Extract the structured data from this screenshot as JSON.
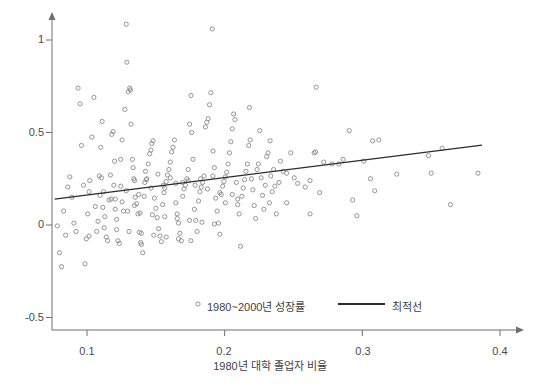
{
  "chart_data": {
    "type": "scatter",
    "title": "",
    "xlabel": "1980년 대학 졸업자 비율",
    "ylabel": "",
    "xlim": [
      0.072,
      0.415
    ],
    "ylim": [
      -0.52,
      1.13
    ],
    "grid": false,
    "xticks": [
      "0.1",
      "0.2",
      "0.3",
      "0.4"
    ],
    "xtick_values": [
      0.1,
      0.2,
      0.3,
      0.4
    ],
    "yticks": [
      "1",
      "0.5",
      "0",
      "-0.5"
    ],
    "ytick_values": [
      1,
      0.5,
      0,
      -0.5
    ],
    "legend_position": "lower-center",
    "series": [
      {
        "name": "1980~2000년 성장률",
        "marker": "open-circle",
        "color": "#8a8a8a",
        "points": [
          [
            0.0785,
            -0.005
          ],
          [
            0.08,
            -0.15
          ],
          [
            0.0815,
            -0.225
          ],
          [
            0.083,
            0.075
          ],
          [
            0.0845,
            -0.055
          ],
          [
            0.086,
            0.205
          ],
          [
            0.0875,
            0.26
          ],
          [
            0.089,
            0.15
          ],
          [
            0.0905,
            0.01
          ],
          [
            0.092,
            -0.035
          ],
          [
            0.0935,
            0.74
          ],
          [
            0.095,
            0.655
          ],
          [
            0.096,
            0.43
          ],
          [
            0.0975,
            0.215
          ],
          [
            0.0985,
            -0.21
          ],
          [
            0.0995,
            -0.075
          ],
          [
            0.1005,
            0.06
          ],
          [
            0.1015,
            -0.06
          ],
          [
            0.102,
            0.24
          ],
          [
            0.1035,
            0.475
          ],
          [
            0.105,
            0.69
          ],
          [
            0.106,
            0.1
          ],
          [
            0.107,
            -0.035
          ],
          [
            0.108,
            0.02
          ],
          [
            0.109,
            0.265
          ],
          [
            0.11,
            0.42
          ],
          [
            0.111,
            0.56
          ],
          [
            0.112,
            0.18
          ],
          [
            0.113,
            0.045
          ],
          [
            0.114,
            -0.065
          ],
          [
            0.115,
            -0.085
          ],
          [
            0.116,
            0.135
          ],
          [
            0.117,
            0.27
          ],
          [
            0.118,
            0.49
          ],
          [
            0.119,
            0.505
          ],
          [
            0.12,
            0.345
          ],
          [
            0.1205,
            0.14
          ],
          [
            0.1215,
            0.03
          ],
          [
            0.1225,
            -0.085
          ],
          [
            0.1235,
            -0.1
          ],
          [
            0.1245,
            0.21
          ],
          [
            0.1255,
            0.46
          ],
          [
            0.1265,
            0.075
          ],
          [
            0.1275,
            0.625
          ],
          [
            0.1285,
            1.085
          ],
          [
            0.129,
            0.88
          ],
          [
            0.13,
            0.72
          ],
          [
            0.131,
            0.74
          ],
          [
            0.1315,
            0.73
          ],
          [
            0.132,
            0.545
          ],
          [
            0.133,
            0.355
          ],
          [
            0.134,
            0.25
          ],
          [
            0.1345,
            0.24
          ],
          [
            0.135,
            0.15
          ],
          [
            0.136,
            0.115
          ],
          [
            0.137,
            0.06
          ],
          [
            0.138,
            -0.04
          ],
          [
            0.139,
            -0.095
          ],
          [
            0.1395,
            -0.105
          ],
          [
            0.1405,
            -0.15
          ],
          [
            0.1415,
            0.155
          ],
          [
            0.142,
            0.23
          ],
          [
            0.143,
            0.245
          ],
          [
            0.1435,
            0.25
          ],
          [
            0.1445,
            0.33
          ],
          [
            0.1455,
            0.385
          ],
          [
            0.1465,
            0.405
          ],
          [
            0.147,
            0.44
          ],
          [
            0.148,
            0.455
          ],
          [
            0.149,
            0.145
          ],
          [
            0.15,
            0.09
          ],
          [
            0.151,
            0.04
          ],
          [
            0.152,
            -0.02
          ],
          [
            0.153,
            -0.06
          ],
          [
            0.154,
            -0.09
          ],
          [
            0.155,
            0.11
          ],
          [
            0.156,
            0.175
          ],
          [
            0.1565,
            0.2
          ],
          [
            0.1575,
            0.235
          ],
          [
            0.1585,
            0.27
          ],
          [
            0.1595,
            0.3
          ],
          [
            0.1605,
            0.34
          ],
          [
            0.1615,
            0.395
          ],
          [
            0.1625,
            0.42
          ],
          [
            0.1635,
            0.46
          ],
          [
            0.1645,
            0.12
          ],
          [
            0.1655,
            0.06
          ],
          [
            0.1665,
            0.01
          ],
          [
            0.1675,
            -0.045
          ],
          [
            0.1685,
            -0.085
          ],
          [
            0.1695,
            0.155
          ],
          [
            0.1705,
            0.195
          ],
          [
            0.1715,
            0.215
          ],
          [
            0.1725,
            0.25
          ],
          [
            0.1735,
            0.3
          ],
          [
            0.1745,
            0.545
          ],
          [
            0.1755,
            0.7
          ],
          [
            0.176,
            0.5
          ],
          [
            0.177,
            0.355
          ],
          [
            0.178,
            0.085
          ],
          [
            0.179,
            0.025
          ],
          [
            0.18,
            -0.035
          ],
          [
            0.181,
            0.13
          ],
          [
            0.182,
            0.18
          ],
          [
            0.183,
            0.205
          ],
          [
            0.184,
            0.23
          ],
          [
            0.185,
            0.265
          ],
          [
            0.186,
            0.53
          ],
          [
            0.187,
            0.555
          ],
          [
            0.188,
            0.575
          ],
          [
            0.189,
            0.65
          ],
          [
            0.19,
            0.715
          ],
          [
            0.191,
            1.06
          ],
          [
            0.1915,
            0.4
          ],
          [
            0.1925,
            0.31
          ],
          [
            0.1935,
            0.145
          ],
          [
            0.1945,
            0.075
          ],
          [
            0.1955,
            0.01
          ],
          [
            0.1965,
            -0.05
          ],
          [
            0.1975,
            0.165
          ],
          [
            0.1985,
            0.21
          ],
          [
            0.1995,
            0.235
          ],
          [
            0.2005,
            0.26
          ],
          [
            0.2015,
            0.285
          ],
          [
            0.2025,
            0.33
          ],
          [
            0.2035,
            0.39
          ],
          [
            0.2045,
            0.45
          ],
          [
            0.2055,
            0.52
          ],
          [
            0.2065,
            0.6
          ],
          [
            0.2075,
            0.57
          ],
          [
            0.2085,
            0.23
          ],
          [
            0.2095,
            0.14
          ],
          [
            0.2105,
            0.06
          ],
          [
            0.2115,
            -0.115
          ],
          [
            0.2125,
            0.155
          ],
          [
            0.2135,
            0.2
          ],
          [
            0.2145,
            0.245
          ],
          [
            0.2155,
            0.29
          ],
          [
            0.2165,
            0.33
          ],
          [
            0.2175,
            0.43
          ],
          [
            0.2185,
            0.46
          ],
          [
            0.2195,
            0.25
          ],
          [
            0.2205,
            0.19
          ],
          [
            0.2215,
            0.105
          ],
          [
            0.2225,
            0.035
          ],
          [
            0.2235,
            0.3
          ],
          [
            0.2245,
            0.33
          ],
          [
            0.2255,
            0.51
          ],
          [
            0.2265,
            0.255
          ],
          [
            0.2275,
            0.16
          ],
          [
            0.2285,
            0.085
          ],
          [
            0.2295,
            0.215
          ],
          [
            0.2305,
            0.37
          ],
          [
            0.2315,
            0.39
          ],
          [
            0.2325,
            0.12
          ],
          [
            0.2335,
            0.265
          ],
          [
            0.2345,
            0.18
          ],
          [
            0.2355,
            0.3
          ],
          [
            0.2365,
            0.21
          ],
          [
            0.2375,
            0.06
          ],
          [
            0.1105,
            0.255
          ],
          [
            0.1195,
            0.215
          ],
          [
            0.1285,
            0.185
          ],
          [
            0.1375,
            0.165
          ],
          [
            0.1465,
            0.2
          ],
          [
            0.1555,
            0.215
          ],
          [
            0.1645,
            0.225
          ],
          [
            0.1735,
            0.24
          ],
          [
            0.1825,
            0.25
          ],
          [
            0.1915,
            0.265
          ],
          [
            0.2005,
            0.12
          ],
          [
            0.2095,
            0.11
          ],
          [
            0.1115,
            0.095
          ],
          [
            0.1205,
            0.085
          ],
          [
            0.1295,
            0.075
          ],
          [
            0.1385,
            0.065
          ],
          [
            0.1475,
            0.055
          ],
          [
            0.1565,
            0.045
          ],
          [
            0.1655,
            0.035
          ],
          [
            0.1745,
            0.025
          ],
          [
            0.1835,
            0.015
          ],
          [
            0.1925,
            0.005
          ],
          [
            0.1125,
            -0.015
          ],
          [
            0.1215,
            -0.025
          ],
          [
            0.1305,
            -0.035
          ],
          [
            0.1395,
            -0.045
          ],
          [
            0.1485,
            -0.055
          ],
          [
            0.1575,
            -0.065
          ],
          [
            0.1665,
            -0.075
          ],
          [
            0.1755,
            -0.085
          ],
          [
            0.1245,
            0.355
          ],
          [
            0.1335,
            0.31
          ],
          [
            0.1425,
            0.29
          ],
          [
            0.1515,
            0.275
          ],
          [
            0.1605,
            0.255
          ],
          [
            0.1695,
            0.23
          ],
          [
            0.1785,
            0.215
          ],
          [
            0.1875,
            0.195
          ],
          [
            0.1965,
            0.175
          ],
          [
            0.2055,
            0.165
          ],
          [
            0.1015,
            0.18
          ],
          [
            0.1095,
            0.16
          ],
          [
            0.1175,
            0.14
          ],
          [
            0.1255,
            0.125
          ],
          [
            0.1345,
            0.105
          ],
          [
            0.2395,
            0.23
          ],
          [
            0.2405,
            0.345
          ],
          [
            0.2425,
            0.29
          ],
          [
            0.245,
            0.28
          ],
          [
            0.248,
            0.39
          ],
          [
            0.2505,
            0.255
          ],
          [
            0.253,
            0.225
          ],
          [
            0.2585,
            0.205
          ],
          [
            0.262,
            0.24
          ],
          [
            0.265,
            0.39
          ],
          [
            0.266,
            0.395
          ],
          [
            0.2665,
            0.745
          ],
          [
            0.269,
            0.175
          ],
          [
            0.272,
            0.34
          ],
          [
            0.278,
            0.33
          ],
          [
            0.283,
            0.33
          ],
          [
            0.286,
            0.355
          ],
          [
            0.2905,
            0.51
          ],
          [
            0.293,
            0.135
          ],
          [
            0.296,
            0.05
          ],
          [
            0.301,
            0.345
          ],
          [
            0.306,
            0.25
          ],
          [
            0.3075,
            0.455
          ],
          [
            0.309,
            0.185
          ],
          [
            0.312,
            0.46
          ],
          [
            0.325,
            0.275
          ],
          [
            0.348,
            0.375
          ],
          [
            0.35,
            0.28
          ],
          [
            0.358,
            0.415
          ],
          [
            0.364,
            0.11
          ],
          [
            0.384,
            0.28
          ],
          [
            0.245,
            0.12
          ],
          [
            0.262,
            0.06
          ],
          [
            0.233,
            0.455
          ],
          [
            0.218,
            0.635
          ]
        ]
      }
    ],
    "trendline": {
      "name": "최적선",
      "color": "#2b2b2b",
      "x0": 0.0765,
      "y0": 0.14,
      "x1": 0.387,
      "y1": 0.432
    }
  },
  "axes": {
    "y_ticks": [
      {
        "label": "1",
        "value": 1
      },
      {
        "label": "0.5",
        "value": 0.5
      },
      {
        "label": "0",
        "value": 0
      },
      {
        "label": "-0.5",
        "value": -0.5
      }
    ],
    "x_ticks": [
      {
        "label": "0.1",
        "value": 0.1
      },
      {
        "label": "0.2",
        "value": 0.2
      },
      {
        "label": "0.3",
        "value": 0.3
      },
      {
        "label": "0.4",
        "value": 0.4
      }
    ],
    "x_title": "1980년 대학 졸업자 비율"
  },
  "legend": {
    "scatter_label": "1980~2000년 성장률",
    "line_label": "최적선"
  },
  "colors": {
    "axis": "#6f6f6f",
    "marker_stroke": "#8f8f8f",
    "trendline": "#2b2b2b",
    "text": "#3f3f3f",
    "background": "#ffffff"
  }
}
